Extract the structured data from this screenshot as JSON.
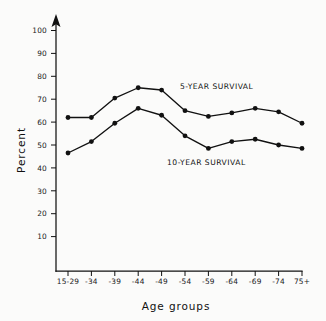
{
  "chart_data": {
    "type": "line",
    "title": "",
    "xlabel": "Age groups",
    "ylabel": "Percent",
    "categories": [
      "15-29",
      "-34",
      "-39",
      "-44",
      "-49",
      "-54",
      "-59",
      "-64",
      "-69",
      "-74",
      "75+"
    ],
    "ylim": [
      0,
      105
    ],
    "yticks": [
      10,
      20,
      30,
      40,
      50,
      60,
      70,
      80,
      90,
      100
    ],
    "ytick_labels": [
      "10",
      "20",
      "30",
      "40",
      "50",
      "60",
      "70",
      "80",
      "90",
      "100"
    ],
    "grid": false,
    "legend_position": "inline-annotation",
    "series": [
      {
        "name": "5-YEAR SURVIVAL",
        "values": [
          62,
          62,
          70.5,
          75,
          74,
          65,
          62.5,
          64,
          66,
          64.5,
          59.5
        ]
      },
      {
        "name": "10-YEAR SURVIVAL",
        "values": [
          46.5,
          51.5,
          59.5,
          66,
          63,
          54,
          48.5,
          51.5,
          52.5,
          50,
          48.5
        ]
      }
    ],
    "annotations": [
      {
        "text": "5-YEAR SURVIVAL",
        "x_category": "-49",
        "y_value": 76
      },
      {
        "text": "10-YEAR SURVIVAL",
        "x_category": "-54",
        "y_value": 44
      }
    ]
  },
  "axis": {
    "y_axis_name": "percent-axis",
    "x_axis_name": "age-groups-axis",
    "arrow": "up-arrow"
  }
}
